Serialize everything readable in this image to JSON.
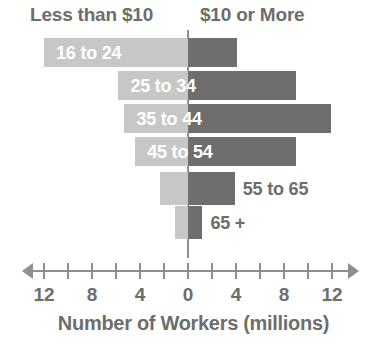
{
  "chart_data": {
    "type": "bar",
    "subtype": "diverging-horizontal-bar",
    "title": "",
    "xlabel": "Number of Workers (millions)",
    "ylabel": "",
    "categories": [
      "16 to 24",
      "25 to 34",
      "35 to 44",
      "45 to 54",
      "55 to 65",
      "65 +"
    ],
    "series": [
      {
        "name": "Less than $10",
        "side": "left",
        "color": "#c7c7c7",
        "values": [
          12.0,
          5.8,
          5.3,
          4.4,
          2.3,
          1.1
        ]
      },
      {
        "name": "$10 or More",
        "side": "right",
        "color": "#6e6e6e",
        "values": [
          4.1,
          9.0,
          11.9,
          9.0,
          3.9,
          1.2
        ]
      }
    ],
    "axis": {
      "tick_values": [
        -12,
        -10,
        -8,
        -6,
        -4,
        -2,
        0,
        2,
        4,
        6,
        8,
        10,
        12
      ],
      "labeled_ticks": [
        {
          "value": -12,
          "label": "12"
        },
        {
          "value": -8,
          "label": "8"
        },
        {
          "value": -4,
          "label": "4"
        },
        {
          "value": 0,
          "label": "0"
        },
        {
          "value": 4,
          "label": "4"
        },
        {
          "value": 8,
          "label": "8"
        },
        {
          "value": 12,
          "label": "12"
        }
      ],
      "xlim": [
        -13.5,
        13.5
      ],
      "grid": false,
      "double_arrow": true
    },
    "legend_position": "top",
    "label_placement": [
      "inside",
      "inside",
      "inside",
      "inside",
      "outside-right",
      "outside-right"
    ]
  },
  "header": {
    "left_label": "Less than $10",
    "right_label": "$10 or More"
  },
  "bars": [
    {
      "label": "16 to 24",
      "left_value": 12.0,
      "right_value": 4.1,
      "label_placement": "inside"
    },
    {
      "label": "25 to 34",
      "left_value": 5.8,
      "right_value": 9.0,
      "label_placement": "inside"
    },
    {
      "label": "35 to 44",
      "left_value": 5.3,
      "right_value": 11.9,
      "label_placement": "inside"
    },
    {
      "label": "45 to 54",
      "left_value": 4.4,
      "right_value": 9.0,
      "label_placement": "inside"
    },
    {
      "label": "55 to 65",
      "left_value": 2.3,
      "right_value": 3.9,
      "label_placement": "outside"
    },
    {
      "label": "65 +",
      "left_value": 1.1,
      "right_value": 1.2,
      "label_placement": "outside"
    }
  ],
  "axis_labels": [
    "12",
    "8",
    "4",
    "0",
    "4",
    "8",
    "12"
  ],
  "axis_title": "Number of Workers (millions)",
  "colors": {
    "left_segment": "#c7c7c7",
    "right_segment": "#6e6e6e",
    "text": "#6d6d6d",
    "axis": "#8f8f8f",
    "inside_label": "#ffffff",
    "background": "#ffffff"
  }
}
